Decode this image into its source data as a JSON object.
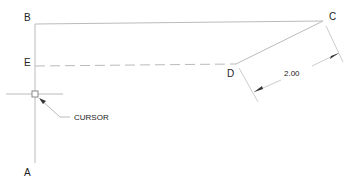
{
  "diagram": {
    "points": {
      "A": "A",
      "B": "B",
      "C": "C",
      "D": "D",
      "E": "E"
    },
    "cursor_label": "CURSOR",
    "dimension_value": "2.00",
    "colors": {
      "line": "#bbbbbb",
      "text": "#222222",
      "arrow": "#333333"
    }
  }
}
